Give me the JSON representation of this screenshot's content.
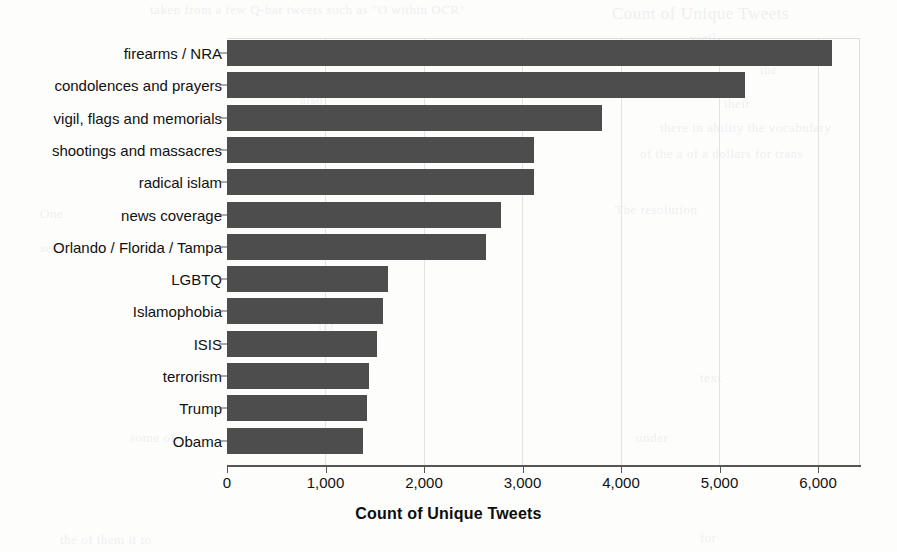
{
  "chart_data": {
    "type": "bar",
    "orientation": "horizontal",
    "title": "",
    "xlabel": "Count of Unique Tweets",
    "ylabel": "",
    "xlim": [
      0,
      6430
    ],
    "xticks": [
      0,
      1000,
      2000,
      3000,
      4000,
      5000,
      6000
    ],
    "xticklabels": [
      "0",
      "1,000",
      "2,000",
      "3,000",
      "4,000",
      "5,000",
      "6,000"
    ],
    "grid": "vertical-light",
    "legend": "none",
    "bar_color": "#4d4d4d",
    "categories": [
      "firearms / NRA",
      "condolences and prayers",
      "vigil, flags and memorials",
      "shootings and massacres",
      "radical islam",
      "news coverage",
      "Orlando / Florida / Tampa",
      "LGBTQ",
      "Islamophobia",
      "ISIS",
      "terrorism",
      "Trump",
      "Obama"
    ],
    "values": [
      6140,
      5260,
      3810,
      3120,
      3120,
      2780,
      2630,
      1630,
      1580,
      1520,
      1440,
      1420,
      1380
    ]
  },
  "figure": {
    "background_artifacts": [
      {
        "text": "Count of Unique Tweets",
        "x": 612,
        "y": 4,
        "size": 17
      },
      {
        "text": "taken from a few Q-bar tweets such as \"O within OCR\"",
        "x": 150,
        "y": 2,
        "size": 13
      },
      {
        "text": "vigil",
        "x": 690,
        "y": 30,
        "size": 13
      },
      {
        "text": "the",
        "x": 760,
        "y": 62,
        "size": 13
      },
      {
        "text": "also",
        "x": 300,
        "y": 92,
        "size": 13
      },
      {
        "text": "their",
        "x": 724,
        "y": 96,
        "size": 13
      },
      {
        "text": "there in ability the vocabulary",
        "x": 660,
        "y": 120,
        "size": 13
      },
      {
        "text": "of the a of a dollars for trans",
        "x": 640,
        "y": 146,
        "size": 13
      },
      {
        "text": "One",
        "x": 40,
        "y": 206,
        "size": 13
      },
      {
        "text": "The resolution",
        "x": 615,
        "y": 202,
        "size": 13
      },
      {
        "text": "seen",
        "x": 40,
        "y": 240,
        "size": 13
      },
      {
        "text": "into",
        "x": 338,
        "y": 278,
        "size": 13
      },
      {
        "text": "for",
        "x": 318,
        "y": 318,
        "size": 13
      },
      {
        "text": "this",
        "x": 310,
        "y": 360,
        "size": 13
      },
      {
        "text": "text",
        "x": 700,
        "y": 370,
        "size": 13
      },
      {
        "text": "all",
        "x": 330,
        "y": 398,
        "size": 13
      },
      {
        "text": "some of",
        "x": 130,
        "y": 430,
        "size": 13
      },
      {
        "text": "under",
        "x": 636,
        "y": 430,
        "size": 13
      },
      {
        "text": "the of them it to",
        "x": 60,
        "y": 532,
        "size": 13
      },
      {
        "text": "for",
        "x": 700,
        "y": 530,
        "size": 13
      }
    ]
  }
}
